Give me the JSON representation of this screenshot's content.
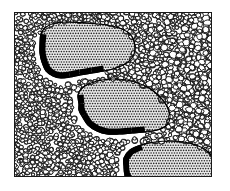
{
  "figure": {
    "kind": "line-art-illustration",
    "title": "",
    "caption": "",
    "background_color": "#ffffff",
    "ink_color": "#000000",
    "shadow_color": "#000000",
    "matrix_fill_color": "#ffffff",
    "clast_fill_tone": "#808080",
    "frame": {
      "x": 14,
      "y": 12,
      "width": 198,
      "height": 165,
      "border_color": "#1a1a1a",
      "border_width": 1
    },
    "matrix": {
      "name": "fine pebble matrix",
      "pattern": "packed outlined pebbles",
      "pebble_count": 1500,
      "pebble_min_radius": 1.6,
      "pebble_max_radius": 4.2,
      "outline_color": "#111111",
      "outline_width": 0.9,
      "fill_color": "#ffffff"
    },
    "clasts": [
      {
        "id": "clast-top-left",
        "label": "",
        "fill_pattern": "halftone-dot-screen",
        "dot_spacing": 2.6,
        "dot_radius": 0.82,
        "dot_color": "#2b2b2b",
        "base_color": "#e8e8e8",
        "outline_color": "#000000",
        "shadow_side": "bottom-left",
        "shadow_thickness": 5.5,
        "outline": [
          [
            40,
            44
          ],
          [
            41,
            34
          ],
          [
            46,
            27
          ],
          [
            56,
            23
          ],
          [
            70,
            22
          ],
          [
            86,
            23
          ],
          [
            100,
            24
          ],
          [
            112,
            26
          ],
          [
            122,
            29
          ],
          [
            130,
            34
          ],
          [
            134,
            41
          ],
          [
            135,
            50
          ],
          [
            132,
            58
          ],
          [
            125,
            64
          ],
          [
            116,
            68
          ],
          [
            104,
            71
          ],
          [
            92,
            73
          ],
          [
            80,
            75
          ],
          [
            70,
            77
          ],
          [
            61,
            78
          ],
          [
            53,
            76
          ],
          [
            46,
            71
          ],
          [
            42,
            62
          ],
          [
            40,
            53
          ]
        ]
      },
      {
        "id": "clast-middle",
        "label": "",
        "fill_pattern": "halftone-dot-screen",
        "dot_spacing": 2.6,
        "dot_radius": 0.82,
        "dot_color": "#2b2b2b",
        "base_color": "#e8e8e8",
        "outline_color": "#000000",
        "shadow_side": "bottom-left",
        "shadow_thickness": 5.5,
        "outline": [
          [
            79,
            104
          ],
          [
            78,
            95
          ],
          [
            82,
            88
          ],
          [
            91,
            83
          ],
          [
            102,
            80
          ],
          [
            114,
            79
          ],
          [
            126,
            80
          ],
          [
            138,
            83
          ],
          [
            149,
            88
          ],
          [
            158,
            95
          ],
          [
            165,
            103
          ],
          [
            169,
            111
          ],
          [
            170,
            119
          ],
          [
            166,
            126
          ],
          [
            157,
            130
          ],
          [
            145,
            132
          ],
          [
            132,
            133
          ],
          [
            119,
            134
          ],
          [
            107,
            134
          ],
          [
            97,
            131
          ],
          [
            88,
            125
          ],
          [
            82,
            116
          ],
          [
            79,
            110
          ]
        ]
      },
      {
        "id": "clast-bottom-right",
        "label": "",
        "fill_pattern": "halftone-dot-screen",
        "dot_spacing": 2.6,
        "dot_radius": 0.82,
        "dot_color": "#2b2b2b",
        "base_color": "#e8e8e8",
        "outline_color": "#000000",
        "shadow_side": "bottom-left",
        "shadow_thickness": 5.0,
        "clipped_by_frame": true,
        "outline": [
          [
            124,
            166
          ],
          [
            124,
            158
          ],
          [
            130,
            150
          ],
          [
            141,
            145
          ],
          [
            155,
            142
          ],
          [
            170,
            141
          ],
          [
            184,
            142
          ],
          [
            196,
            145
          ],
          [
            206,
            150
          ],
          [
            212,
            157
          ],
          [
            213,
            168
          ],
          [
            213,
            182
          ],
          [
            130,
            182
          ],
          [
            125,
            175
          ]
        ]
      }
    ]
  }
}
